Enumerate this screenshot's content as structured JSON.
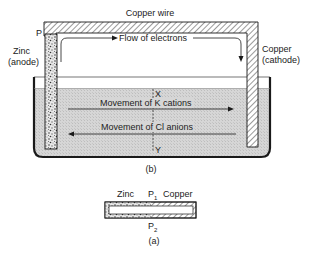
{
  "diagram": {
    "title_b": "(b)",
    "title_a": "(a)",
    "labels": {
      "copper_wire": "Copper wire",
      "point_p": "P",
      "zinc_line1": "Zinc",
      "zinc_line2": "(anode)",
      "copper_line1": "Copper",
      "copper_line2": "(cathode)",
      "flow_electrons": "Flow of electrons",
      "point_x": "X",
      "point_y": "Y",
      "k_cations": "Movement of K cations",
      "cl_anions": "Movement of Cl anions"
    },
    "small_diagram": {
      "zinc": "Zinc",
      "p1": "P",
      "p1_sub": "1",
      "copper": "Copper",
      "p2": "P",
      "p2_sub": "2"
    },
    "colors": {
      "line": "#1a1a1a",
      "solution": "#d4d4d4",
      "hatch": "#555555",
      "background": "#ffffff"
    }
  }
}
